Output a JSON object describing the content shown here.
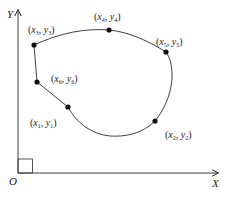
{
  "diagram": {
    "colors": {
      "stroke": "#2a2a2a",
      "point": "#111111",
      "text": "#222222",
      "background": "#ffffff"
    },
    "axes": {
      "x_label": "X",
      "y_label": "Y",
      "origin_label": "O"
    },
    "points": [
      {
        "id": "p1",
        "var_x": "x",
        "var_y": "y",
        "sub": "1",
        "label": "(x1, y1)",
        "cx": 68,
        "cy": 107,
        "lx": 30,
        "ly": 126
      },
      {
        "id": "p2",
        "var_x": "x",
        "var_y": "y",
        "sub": "2",
        "label": "(x2, y2)",
        "cx": 155,
        "cy": 121,
        "lx": 165,
        "ly": 138
      },
      {
        "id": "p3",
        "var_x": "x",
        "var_y": "y",
        "sub": "3",
        "label": "(x3, y3)",
        "cx": 34,
        "cy": 45,
        "lx": 28,
        "ly": 33
      },
      {
        "id": "p4",
        "var_x": "x",
        "var_y": "y",
        "sub": "4",
        "label": "(x4, y4)",
        "cx": 109,
        "cy": 30,
        "lx": 94,
        "ly": 20
      },
      {
        "id": "p5",
        "var_x": "x",
        "var_y": "y",
        "sub": "5",
        "label": "(x5, y5)",
        "cx": 166,
        "cy": 52,
        "lx": 156,
        "ly": 45
      },
      {
        "id": "p6",
        "var_x": "x",
        "var_y": "y",
        "sub": "6",
        "label": "(x6, y6)",
        "cx": 37,
        "cy": 82,
        "lx": 51,
        "ly": 82
      }
    ]
  }
}
